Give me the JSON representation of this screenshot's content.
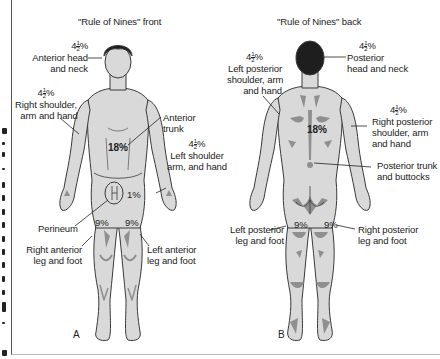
{
  "front": {
    "title": "\"Rule of Nines\" front",
    "panel_letter": "A",
    "labels": {
      "head": {
        "pct_whole": "4",
        "pct_num": "1",
        "pct_den": "2",
        "pct_sign": "%",
        "line1": "Anterior head",
        "line2": "and neck"
      },
      "right_arm": {
        "pct_whole": "4",
        "pct_num": "1",
        "pct_den": "2",
        "pct_sign": "%",
        "line1": "Right shoulder,",
        "line2": "arm and hand"
      },
      "trunk": {
        "line1": "Anterior",
        "line2": "trunk",
        "value": "18%"
      },
      "left_arm": {
        "pct_whole": "4",
        "pct_num": "1",
        "pct_den": "2",
        "pct_sign": "%",
        "line1": "Left shoulder",
        "line2": "arm, and hand"
      },
      "perineum": {
        "label": "Perineum",
        "value": "1%"
      },
      "right_leg": {
        "line1": "Right anterior",
        "line2": "leg and foot",
        "value": "9%"
      },
      "left_leg": {
        "line1": "Left anterior",
        "line2": "leg and foot",
        "value": "9%"
      }
    }
  },
  "back": {
    "title": "\"Rule of Nines\" back",
    "panel_letter": "B",
    "labels": {
      "head": {
        "pct_whole": "4",
        "pct_num": "1",
        "pct_den": "2",
        "pct_sign": "%",
        "line1": "Posterior",
        "line2": "head and neck"
      },
      "left_arm": {
        "pct_whole": "4",
        "pct_num": "1",
        "pct_den": "2",
        "pct_sign": "%",
        "line1": "Left posterior",
        "line2": "shoulder, arm",
        "line3": "and hand"
      },
      "right_arm": {
        "pct_whole": "4",
        "pct_num": "1",
        "pct_den": "2",
        "pct_sign": "%",
        "line1": "Right posterior",
        "line2": "shoulder, arm",
        "line3": "and hand"
      },
      "trunk": {
        "line1": "Posterior trunk",
        "line2": "and buttocks",
        "value": "18%"
      },
      "left_leg": {
        "line1": "Left posterior",
        "line2": "leg and foot",
        "value": "9%"
      },
      "right_leg": {
        "line1": "Right posterior",
        "line2": "leg and foot",
        "value": "9%"
      }
    }
  },
  "colors": {
    "skin": "#d9d9d9",
    "shadow": "#8f8f8f",
    "outline": "#3a3a3a",
    "hair": "#1e1e1e"
  }
}
